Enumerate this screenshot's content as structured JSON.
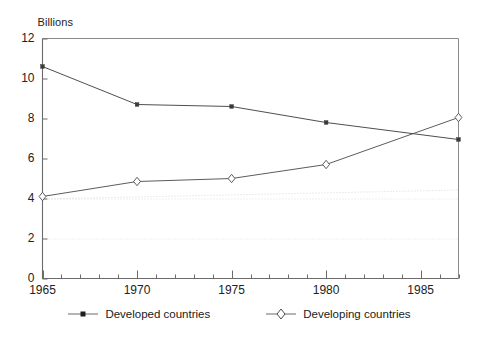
{
  "chart_data": {
    "type": "line",
    "title": "",
    "subtitle": "",
    "unit_label": "Billions",
    "xlabel": "",
    "ylabel": "",
    "xlim": [
      1965,
      1987
    ],
    "ylim": [
      0,
      12
    ],
    "x_ticks": [
      1965,
      1970,
      1975,
      1980,
      1985
    ],
    "x_tick_labels": [
      "1965",
      "1970",
      "1975",
      "1980",
      "1985"
    ],
    "x_minor_tick_step": 1,
    "y_ticks": [
      0,
      2,
      4,
      6,
      8,
      10,
      12
    ],
    "y_tick_labels": [
      "0",
      "2",
      "4",
      "6",
      "8",
      "10",
      "12"
    ],
    "grid": "faint-dotted-horizontal",
    "legend_position": "bottom-center",
    "x": [
      1965,
      1970,
      1975,
      1980,
      1987
    ],
    "series": [
      {
        "name": "Developed countries",
        "marker": "filled-dot",
        "color": "#3a3a3a",
        "values": [
          10.6,
          8.7,
          8.6,
          7.8,
          6.95
        ]
      },
      {
        "name": "Developing countries",
        "marker": "open-diamond",
        "color": "#4a4a4a",
        "values": [
          4.1,
          4.85,
          5.0,
          5.7,
          8.05
        ]
      }
    ]
  },
  "legend": {
    "entries": [
      {
        "label": "Developed countries",
        "marker": "filled-dot"
      },
      {
        "label": "Developing countries",
        "marker": "open-diamond"
      }
    ]
  },
  "colors": {
    "axis": "#6b6b6b",
    "frame": "#8a8a8a",
    "series_developed": "#3a3a3a",
    "series_developing": "#4a4a4a",
    "grid": "#d9d9d9",
    "text": "#1a1a1a",
    "background": "#ffffff"
  }
}
